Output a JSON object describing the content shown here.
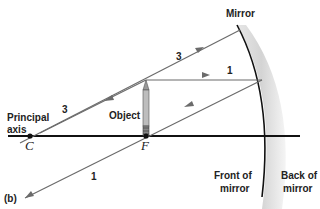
{
  "figure": {
    "panel_label": "(b)",
    "labels": {
      "mirror": "Mirror",
      "object": "Object",
      "principal_axis_line1": "Principal",
      "principal_axis_line2": "axis",
      "center_point": "C",
      "focal_point": "F",
      "front_line1": "Front of",
      "front_line2": "mirror",
      "back_line1": "Back of",
      "back_line2": "mirror"
    },
    "rays": [
      {
        "id": "ray-1-incident",
        "label": "1",
        "description": "parallel to principal axis from object tip to mirror"
      },
      {
        "id": "ray-1-reflected",
        "label": "1",
        "description": "reflected through focal point F"
      },
      {
        "id": "ray-3-incident",
        "label": "3",
        "description": "through center of curvature C to mirror"
      },
      {
        "id": "ray-3-reflected",
        "label": "3",
        "description": "reflected back through C"
      }
    ],
    "colors": {
      "ray": "#6b6b6b",
      "axis": "#111111",
      "mirror_line": "#111111",
      "mirror_back": "#d8d8d8",
      "text": "#222222"
    }
  }
}
